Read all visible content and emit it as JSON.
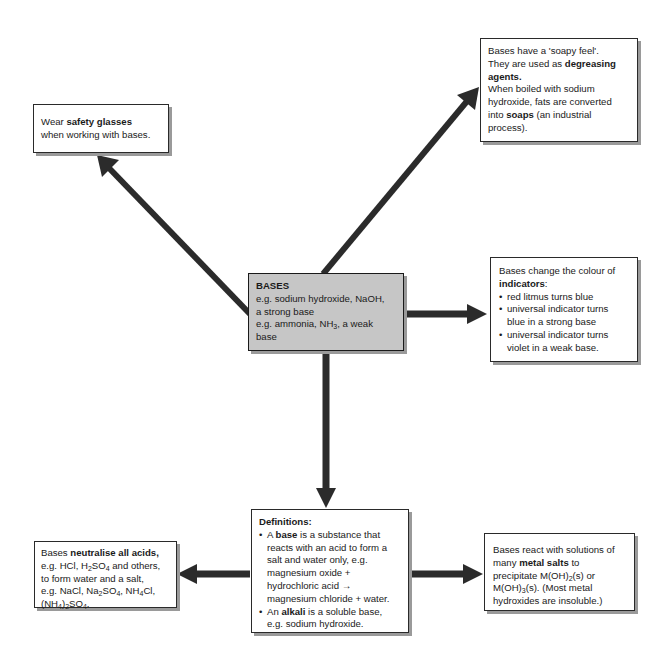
{
  "diagram": {
    "type": "concept map",
    "colors": {
      "center_fill": "#c6c6c6",
      "box_fill": "#ffffff",
      "arrow": "#2b2b2b",
      "shadow": "#9a9a9a"
    },
    "center": {
      "title": "BASES",
      "line1": "e.g. sodium hydroxide, NaOH,",
      "line2": "a strong base",
      "line3_pre": "e.g. ammonia, NH",
      "line3_sub": "3",
      "line3_post": ", a weak",
      "line4": "base"
    },
    "safety": {
      "pre": "Wear ",
      "bold": "safety glasses",
      "line2": "when working with bases."
    },
    "soapy": {
      "line1": "Bases have a 'soapy feel'.",
      "line2_pre": "They are used as ",
      "line2_bold": "degreasing",
      "line3_bold": "agents.",
      "line4": "When boiled with sodium",
      "line5": "hydroxide, fats are converted",
      "line6_pre": "into ",
      "line6_bold": "soaps",
      "line6_post": " (an industrial",
      "line7": "process)."
    },
    "indicators": {
      "line1": "Bases change the colour of",
      "line2_bold": "indicators",
      "line2_post": ":",
      "bullets": [
        [
          "red litmus turns blue"
        ],
        [
          "universal indicator turns",
          "blue in a strong base"
        ],
        [
          "universal indicator turns",
          "violet in a weak base."
        ]
      ]
    },
    "definitions": {
      "title": "Definitions:",
      "b1_pre": "A ",
      "b1_bold": "base",
      "b1_post": " is a substance that",
      "b1_l2": "reacts with an acid to form a",
      "b1_l3": "salt and water only, e.g.",
      "b1_l4": "magnesium oxide +",
      "b1_l5": "hydrochloric acid →",
      "b1_l6": "magnesium chloride + water.",
      "b2_pre": "An ",
      "b2_bold": "alkali",
      "b2_post": " is a soluble base,",
      "b2_l2": "e.g. sodium hydroxide."
    },
    "neutralise": {
      "pre": "Bases ",
      "bold": "neutralise all acids,",
      "l2_a": "e.g. HCl, H",
      "l2_s1": "2",
      "l2_b": "SO",
      "l2_s2": "4",
      "l2_c": " and others,",
      "l3": "to form water and a salt,",
      "l4_a": "e.g. NaCl, Na",
      "l4_s1": "2",
      "l4_b": "SO",
      "l4_s2": "4",
      "l4_c": ", NH",
      "l4_s3": "4",
      "l4_d": "Cl,",
      "l5_a": "(NH",
      "l5_s1": "4",
      "l5_b": ")",
      "l5_s2": "2",
      "l5_c": "SO",
      "l5_s3": "4",
      "l5_d": "."
    },
    "metal": {
      "l1": "Bases react with solutions of",
      "l2_pre": "many ",
      "l2_bold": "metal salts",
      "l2_post": " to",
      "l3_a": "precipitate M(OH)",
      "l3_s": "2",
      "l3_b": "(s) or",
      "l4_a": "M(OH)",
      "l4_s": "3",
      "l4_b": "(s). (Most metal",
      "l5": "hydroxides are insoluble.)"
    }
  }
}
